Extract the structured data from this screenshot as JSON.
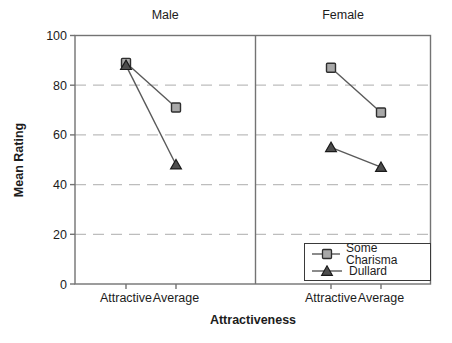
{
  "chart_data": {
    "type": "line",
    "xlabel": "Attractiveness",
    "ylabel": "Mean Rating",
    "ylim": [
      0,
      100
    ],
    "yticks": [
      0,
      20,
      40,
      60,
      80,
      100
    ],
    "grid": "horizontal-dashed",
    "legend_position": "bottom-right",
    "categories": [
      "Attractive",
      "Average"
    ],
    "facets": [
      {
        "title": "Male",
        "series": [
          {
            "name": "Some Charisma",
            "marker": "square",
            "values": [
              89,
              71
            ]
          },
          {
            "name": "Dullard",
            "marker": "triangle",
            "values": [
              88,
              48
            ]
          }
        ]
      },
      {
        "title": "Female",
        "series": [
          {
            "name": "Some Charisma",
            "marker": "square",
            "values": [
              87,
              69
            ]
          },
          {
            "name": "Dullard",
            "marker": "triangle",
            "values": [
              55,
              47
            ]
          }
        ]
      }
    ],
    "legend": {
      "entries": [
        {
          "label": "Some Charisma",
          "marker": "square"
        },
        {
          "label": "Dullard",
          "marker": "triangle"
        }
      ]
    }
  },
  "colors": {
    "background": "#ffffff",
    "frame": "#737373",
    "grid": "#bdbdbd",
    "line": "#5a5a5a",
    "square_fill": "#a8a8a8",
    "square_border": "#2e2e2e",
    "triangle_fill": "#4d4d4d",
    "triangle_border": "#1a1a1a",
    "text": "#1c1c1c"
  }
}
